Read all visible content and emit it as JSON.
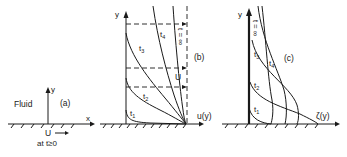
{
  "panel_a": {
    "label": "(a)",
    "fluid_label": "Fluid",
    "x_axis": "x",
    "y_axis": "y",
    "wall_velocity": "U",
    "time_condition": "at t≥0"
  },
  "panel_b": {
    "label": "(b)",
    "y_axis": "y",
    "x_axis": "u(y)",
    "curves": [
      "t1",
      "t2",
      "t3",
      "t4"
    ],
    "curve_labels": {
      "t1": "t",
      "t2": "t",
      "t3": "t",
      "t4": "t"
    },
    "curve_subs": {
      "t1": "1",
      "t2": "2",
      "t3": "3",
      "t4": "4"
    },
    "velocity_label": "U",
    "infinity_label": "t = ∞"
  },
  "panel_c": {
    "label": "(c)",
    "y_axis": "y",
    "x_axis": "ζ(y)",
    "curves": [
      "t1",
      "t2",
      "t3",
      "t4"
    ],
    "curve_labels": {
      "t1": "t",
      "t2": "t",
      "t3": "t",
      "t4": "t"
    },
    "curve_subs": {
      "t1": "1",
      "t2": "2",
      "t3": "3",
      "t4": "4"
    },
    "infinity_label": "t = ∞"
  }
}
